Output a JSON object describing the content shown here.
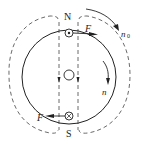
{
  "diagram": {
    "labels": {
      "north": "N",
      "south": "S",
      "force_top": "F",
      "force_bottom": "F",
      "n0": "n",
      "n0_sub": "0",
      "n": "n"
    },
    "symbols": {
      "current_out": "dot-in-circle",
      "current_in": "cross-in-circle"
    },
    "colors": {
      "stroke": "#222222",
      "background": "#ffffff"
    }
  }
}
